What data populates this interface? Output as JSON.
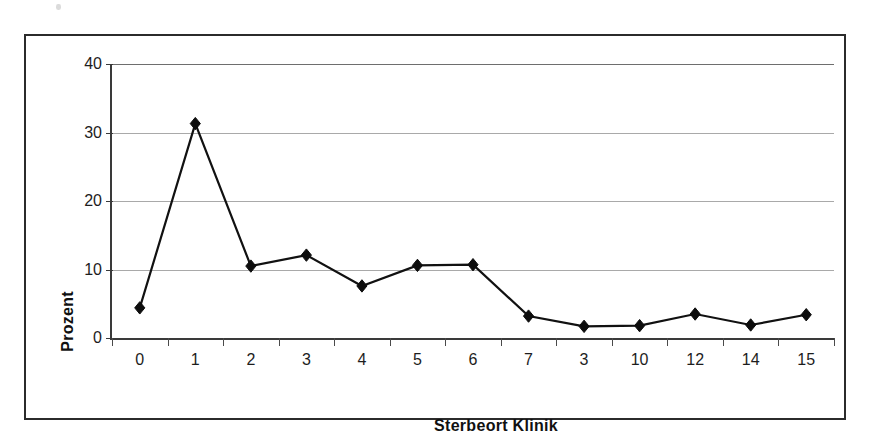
{
  "chart_data": {
    "type": "line",
    "title": "",
    "xlabel": "Sterbeort Klinik",
    "ylabel": "Prozent",
    "categories": [
      "0",
      "1",
      "2",
      "3",
      "4",
      "5",
      "6",
      "7",
      "3",
      "10",
      "12",
      "14",
      "15"
    ],
    "values": [
      4.4,
      31.3,
      10.5,
      12.1,
      7.6,
      10.6,
      10.7,
      3.2,
      1.7,
      1.8,
      3.5,
      1.9,
      3.4
    ],
    "series": [
      {
        "name": "Prozent",
        "values": [
          4.4,
          31.3,
          10.5,
          12.1,
          7.6,
          10.6,
          10.7,
          3.2,
          1.7,
          1.8,
          3.5,
          1.9,
          3.4
        ]
      }
    ],
    "ylim": [
      0,
      40
    ],
    "yticks": [
      0,
      10,
      20,
      30,
      40
    ],
    "ytick_labels": [
      "0",
      "10",
      "20",
      "30",
      "40"
    ],
    "grid": true,
    "grid_axis": "y",
    "legend": false,
    "legend_position": "none",
    "marker": "diamond",
    "line_color": "#111111",
    "marker_color": "#0d0d0d",
    "gridline_color": "#a9a9a9",
    "axis_color": "#3a3a3a",
    "plot_background": "#ffffff",
    "annotations": []
  },
  "figure": {
    "border_color": "#2b2b2b",
    "background": "#ffffff"
  }
}
